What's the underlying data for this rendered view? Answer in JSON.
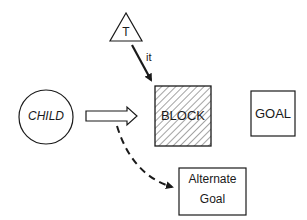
{
  "diagram": {
    "nodes": {
      "teacher": {
        "label": "T",
        "shape": "triangle"
      },
      "child": {
        "label": "CHILD",
        "shape": "circle"
      },
      "block": {
        "label": "BLOCK",
        "shape": "hatched-square"
      },
      "goal": {
        "label": "GOAL",
        "shape": "square"
      },
      "alternate_goal": {
        "label_line1": "Alternate",
        "label_line2": "Goal",
        "shape": "rectangle"
      }
    },
    "edges": {
      "teacher_to_block": {
        "label": "it",
        "style": "solid-arrow"
      },
      "child_to_block": {
        "label": "",
        "style": "hollow-block-arrow"
      },
      "child_to_alternate": {
        "label": "",
        "style": "dashed-curved-arrow"
      }
    }
  },
  "colors": {
    "stroke": "#1a1a1a",
    "background": "#ffffff"
  }
}
